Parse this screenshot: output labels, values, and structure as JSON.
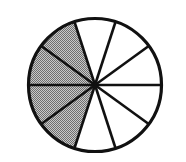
{
  "figure": {
    "kind": "fraction-pie-diagram",
    "background_color": "#ffffff"
  },
  "chart_data": {
    "type": "pie",
    "title": "",
    "subtitle": "",
    "xlabel": "",
    "ylabel": "",
    "grid": false,
    "legend_position": "none",
    "total_slices": 10,
    "slice_angle_degrees": 36,
    "shaded_count": 4,
    "unshaded_count": 6,
    "fraction_shaded": "4/10",
    "fraction_shaded_decimal": 0.4,
    "percent_shaded": 40,
    "start_angle_degrees": 0,
    "center_x": 95,
    "center_y": 85,
    "radius": 66,
    "categories": [
      "slice-1",
      "slice-2",
      "slice-3",
      "slice-4",
      "slice-5",
      "slice-6",
      "slice-7",
      "slice-8",
      "slice-9",
      "slice-10"
    ],
    "values": [
      1,
      1,
      1,
      1,
      1,
      1,
      1,
      1,
      1,
      1
    ],
    "slices": [
      {
        "index": 0,
        "start_deg": 0,
        "end_deg": 36,
        "state": "unshaded",
        "fill": "#ffffff"
      },
      {
        "index": 1,
        "start_deg": 36,
        "end_deg": 72,
        "state": "unshaded",
        "fill": "#ffffff"
      },
      {
        "index": 2,
        "start_deg": 72,
        "end_deg": 108,
        "state": "unshaded",
        "fill": "#ffffff"
      },
      {
        "index": 3,
        "start_deg": 108,
        "end_deg": 144,
        "state": "shaded",
        "fill": "#a3a3a3"
      },
      {
        "index": 4,
        "start_deg": 144,
        "end_deg": 180,
        "state": "shaded",
        "fill": "#a3a3a3"
      },
      {
        "index": 5,
        "start_deg": 180,
        "end_deg": 216,
        "state": "shaded",
        "fill": "#a3a3a3"
      },
      {
        "index": 6,
        "start_deg": 216,
        "end_deg": 252,
        "state": "shaded",
        "fill": "#a3a3a3"
      },
      {
        "index": 7,
        "start_deg": 252,
        "end_deg": 288,
        "state": "unshaded",
        "fill": "#ffffff"
      },
      {
        "index": 8,
        "start_deg": 288,
        "end_deg": 324,
        "state": "unshaded",
        "fill": "#ffffff"
      },
      {
        "index": 9,
        "start_deg": 324,
        "end_deg": 360,
        "state": "unshaded",
        "fill": "#ffffff"
      }
    ]
  },
  "style": {
    "shaded_color": "#a3a3a3",
    "unshaded_color": "#ffffff",
    "line_color": "#111111",
    "outline_width": 3.2,
    "spoke_width": 2.6
  }
}
